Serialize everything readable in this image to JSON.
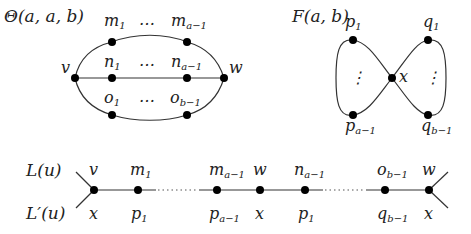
{
  "theta": {
    "title": "Θ(a, a, b)",
    "nodes": {
      "v": "v",
      "w": "w",
      "m1": {
        "base": "m",
        "sub": "1"
      },
      "ma": {
        "base": "m",
        "sub": "a−1"
      },
      "n1": {
        "base": "n",
        "sub": "1"
      },
      "na": {
        "base": "n",
        "sub": "a−1"
      },
      "o1": {
        "base": "o",
        "sub": "1"
      },
      "ob": {
        "base": "o",
        "sub": "b−1"
      }
    },
    "ellipsis": "…"
  },
  "figure8": {
    "title": "F(a, b)",
    "nodes": {
      "x": "x",
      "p1": {
        "base": "p",
        "sub": "1"
      },
      "pa": {
        "base": "p",
        "sub": "a−1"
      },
      "q1": {
        "base": "q",
        "sub": "1"
      },
      "qb": {
        "base": "q",
        "sub": "b−1"
      }
    },
    "vdots": "⋮"
  },
  "line": {
    "top_label": "L(u)",
    "bottom_label": "L′(u)",
    "top_nodes": [
      {
        "base": "v",
        "sub": ""
      },
      {
        "base": "m",
        "sub": "1"
      },
      {
        "base": "m",
        "sub": "a−1"
      },
      {
        "base": "w",
        "sub": ""
      },
      {
        "base": "n",
        "sub": "a−1"
      },
      {
        "base": "o",
        "sub": "b−1"
      },
      {
        "base": "w",
        "sub": ""
      }
    ],
    "bottom_nodes": [
      {
        "base": "x",
        "sub": ""
      },
      {
        "base": "p",
        "sub": "1"
      },
      {
        "base": "p",
        "sub": "a−1"
      },
      {
        "base": "x",
        "sub": ""
      },
      {
        "base": "p",
        "sub": "1"
      },
      {
        "base": "q",
        "sub": "b−1"
      },
      {
        "base": "x",
        "sub": ""
      }
    ]
  }
}
